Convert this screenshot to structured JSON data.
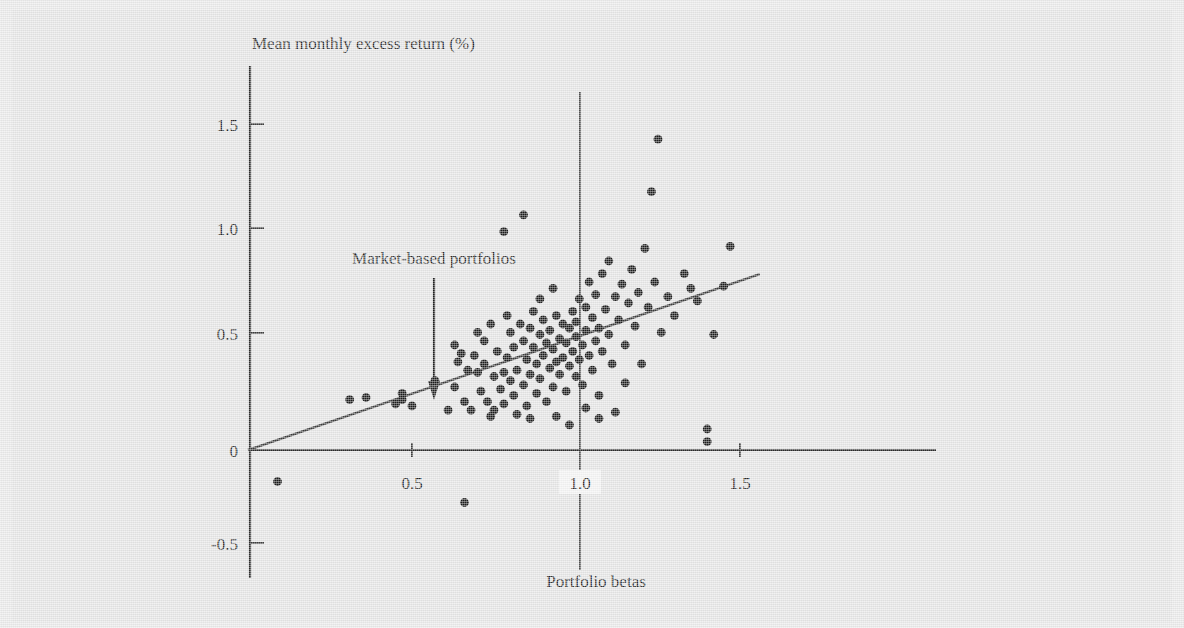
{
  "figure": {
    "background_color": "#e4e4e4",
    "ink_color": "#1b1b1b"
  },
  "chart_data": {
    "type": "scatter",
    "title": "",
    "xlabel": "Portfolio betas",
    "ylabel": "Mean monthly excess return (%)",
    "xlim": [
      -0.02,
      1.62
    ],
    "ylim": [
      -0.62,
      1.68
    ],
    "grid": false,
    "legend": "none",
    "xticks": [
      0.5,
      1.0,
      1.5
    ],
    "xtick_labels": [
      "0.5",
      "1.0",
      "1.5"
    ],
    "yticks": [
      -0.5,
      0,
      0.5,
      1.0,
      1.5
    ],
    "ytick_labels": [
      "-0.5",
      "0",
      "0.5",
      "1.0",
      "1.5"
    ],
    "annotations": [
      {
        "text": "Market-based portfolios",
        "x": 0.42,
        "y": 0.86,
        "arrow_to_x": 0.42,
        "arrow_to_y": 0.27
      }
    ],
    "reference_lines": [
      {
        "name": "market-beta-reference",
        "orientation": "vertical",
        "x": 1.0
      }
    ],
    "fit_line": {
      "name": "security-market-line",
      "intercept": 0.0,
      "slope": 0.537,
      "x_start": 0.0,
      "x_end": 1.56
    },
    "series": [
      {
        "name": "Market-based portfolios",
        "marker": "filled-circle",
        "color": "#1b1b1b",
        "points": [
          [
            0.09,
            -0.15
          ],
          [
            0.31,
            0.24
          ],
          [
            0.36,
            0.25
          ],
          [
            0.45,
            0.22
          ],
          [
            0.47,
            0.27
          ],
          [
            0.47,
            0.24
          ],
          [
            0.5,
            0.21
          ],
          [
            0.57,
            0.33
          ],
          [
            0.61,
            0.19
          ],
          [
            0.63,
            0.3
          ],
          [
            0.63,
            0.5
          ],
          [
            0.64,
            0.42
          ],
          [
            0.65,
            0.46
          ],
          [
            0.66,
            0.23
          ],
          [
            0.66,
            -0.25
          ],
          [
            0.68,
            0.19
          ],
          [
            0.69,
            0.45
          ],
          [
            0.7,
            0.37
          ],
          [
            0.7,
            0.56
          ],
          [
            0.71,
            0.28
          ],
          [
            0.72,
            0.52
          ],
          [
            0.72,
            0.41
          ],
          [
            0.73,
            0.23
          ],
          [
            0.74,
            0.6
          ],
          [
            0.75,
            0.35
          ],
          [
            0.75,
            0.19
          ],
          [
            0.76,
            0.47
          ],
          [
            0.77,
            0.29
          ],
          [
            0.78,
            1.04
          ],
          [
            0.78,
            0.22
          ],
          [
            0.79,
            0.64
          ],
          [
            0.79,
            0.44
          ],
          [
            0.8,
            0.33
          ],
          [
            0.8,
            0.56
          ],
          [
            0.81,
            0.26
          ],
          [
            0.81,
            0.49
          ],
          [
            0.82,
            0.38
          ],
          [
            0.83,
            0.6
          ],
          [
            0.84,
            1.12
          ],
          [
            0.84,
            0.31
          ],
          [
            0.84,
            0.52
          ],
          [
            0.85,
            0.43
          ],
          [
            0.85,
            0.21
          ],
          [
            0.86,
            0.58
          ],
          [
            0.86,
            0.36
          ],
          [
            0.87,
            0.49
          ],
          [
            0.87,
            0.66
          ],
          [
            0.88,
            0.27
          ],
          [
            0.88,
            0.41
          ],
          [
            0.89,
            0.55
          ],
          [
            0.89,
            0.34
          ],
          [
            0.9,
            0.62
          ],
          [
            0.9,
            0.45
          ],
          [
            0.91,
            0.23
          ],
          [
            0.91,
            0.51
          ],
          [
            0.92,
            0.39
          ],
          [
            0.92,
            0.57
          ],
          [
            0.93,
            0.3
          ],
          [
            0.93,
            0.48
          ],
          [
            0.94,
            0.64
          ],
          [
            0.94,
            0.42
          ],
          [
            0.95,
            0.53
          ],
          [
            0.95,
            0.36
          ],
          [
            0.96,
            0.6
          ],
          [
            0.96,
            0.44
          ],
          [
            0.97,
            0.28
          ],
          [
            0.97,
            0.51
          ],
          [
            0.98,
            0.58
          ],
          [
            0.98,
            0.4
          ],
          [
            0.98,
            0.12
          ],
          [
            0.99,
            0.47
          ],
          [
            0.99,
            0.66
          ],
          [
            1.0,
            0.35
          ],
          [
            1.0,
            0.54
          ],
          [
            1.0,
            0.61
          ],
          [
            1.01,
            0.43
          ],
          [
            1.01,
            0.72
          ],
          [
            1.02,
            0.5
          ],
          [
            1.02,
            0.31
          ],
          [
            1.03,
            0.57
          ],
          [
            1.03,
            0.68
          ],
          [
            1.04,
            0.45
          ],
          [
            1.04,
            0.8
          ],
          [
            1.05,
            0.38
          ],
          [
            1.05,
            0.63
          ],
          [
            1.06,
            0.52
          ],
          [
            1.06,
            0.74
          ],
          [
            1.07,
            0.26
          ],
          [
            1.07,
            0.58
          ],
          [
            1.08,
            0.84
          ],
          [
            1.08,
            0.47
          ],
          [
            1.09,
            0.67
          ],
          [
            1.1,
            0.55
          ],
          [
            1.1,
            0.9
          ],
          [
            1.11,
            0.41
          ],
          [
            1.12,
            0.73
          ],
          [
            1.12,
            0.18
          ],
          [
            1.13,
            0.62
          ],
          [
            1.14,
            0.79
          ],
          [
            1.15,
            0.5
          ],
          [
            1.15,
            0.32
          ],
          [
            1.16,
            0.7
          ],
          [
            1.17,
            0.86
          ],
          [
            1.18,
            0.59
          ],
          [
            1.19,
            0.75
          ],
          [
            1.2,
            0.41
          ],
          [
            1.21,
            0.96
          ],
          [
            1.22,
            0.68
          ],
          [
            1.23,
            1.23
          ],
          [
            1.24,
            0.8
          ],
          [
            1.25,
            1.48
          ],
          [
            1.26,
            0.56
          ],
          [
            1.28,
            0.73
          ],
          [
            1.3,
            0.64
          ],
          [
            1.33,
            0.84
          ],
          [
            1.35,
            0.77
          ],
          [
            1.37,
            0.71
          ],
          [
            1.4,
            0.1
          ],
          [
            1.4,
            0.04
          ],
          [
            1.42,
            0.55
          ],
          [
            1.45,
            0.78
          ],
          [
            1.47,
            0.97
          ],
          [
            0.89,
            0.72
          ],
          [
            0.93,
            0.77
          ],
          [
            1.03,
            0.2
          ],
          [
            1.07,
            0.15
          ],
          [
            0.74,
            0.16
          ],
          [
            0.82,
            0.17
          ],
          [
            0.86,
            0.15
          ],
          [
            0.94,
            0.16
          ],
          [
            0.78,
            0.37
          ],
          [
            0.67,
            0.38
          ]
        ]
      }
    ]
  }
}
